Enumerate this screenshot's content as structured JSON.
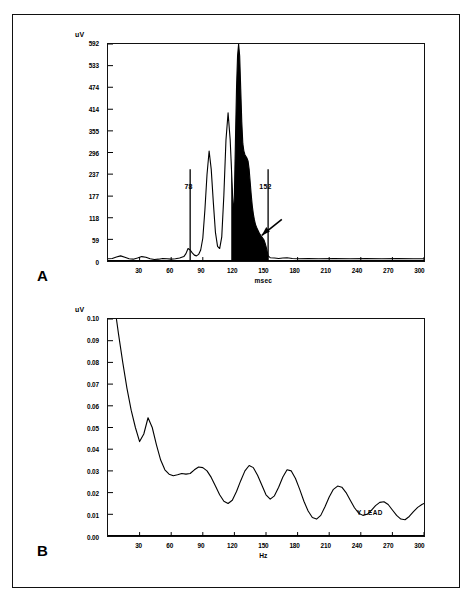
{
  "figure": {
    "panels": [
      {
        "id": "A",
        "letter": "A",
        "y_unit": "uV",
        "x_title": "msec",
        "y_ticks": [
          "592",
          "533",
          "474",
          "414",
          "355",
          "296",
          "237",
          "177",
          "118",
          "59",
          "0"
        ],
        "x_ticks": [
          "30",
          "60",
          "90",
          "120",
          "150",
          "180",
          "210",
          "240",
          "270",
          "300"
        ],
        "markers": [
          {
            "label": "78",
            "value": 78
          },
          {
            "label": "152",
            "value": 152
          }
        ],
        "annotation_icon": "arrow-pointer"
      },
      {
        "id": "B",
        "letter": "B",
        "y_unit": "uV",
        "x_title": "Hz",
        "y_ticks": [
          "0.10",
          "0.09",
          "0.08",
          "0.07",
          "0.06",
          "0.05",
          "0.04",
          "0.03",
          "0.02",
          "0.01",
          "0.00"
        ],
        "x_ticks": [
          "30",
          "60",
          "90",
          "120",
          "150",
          "180",
          "210",
          "240",
          "270",
          "300"
        ],
        "curve_label": "Y LEAD"
      }
    ]
  },
  "chart_data": [
    {
      "type": "line",
      "title": "Signal-averaged QRS complex, high-gain time domain",
      "panel": "A",
      "xlabel": "msec",
      "ylabel": "uV",
      "xlim": [
        0,
        300
      ],
      "ylim": [
        0,
        592
      ],
      "grid": false,
      "legend": "none",
      "xticks": [
        30,
        60,
        90,
        120,
        150,
        180,
        210,
        240,
        270,
        300
      ],
      "yticks": [
        0,
        59,
        118,
        177,
        237,
        296,
        355,
        414,
        474,
        533,
        592
      ],
      "annotations": [
        {
          "text": "78",
          "x": 78,
          "type": "vertical-marker",
          "note": "QRS onset"
        },
        {
          "text": "152",
          "x": 152,
          "type": "vertical-marker",
          "note": "QRS offset"
        },
        {
          "text": "",
          "x": 146,
          "y": 70,
          "type": "arrow",
          "note": "late potentials in terminal QRS"
        }
      ],
      "filled_region": {
        "x_start": 117,
        "x_end": 152,
        "fill": "#000000"
      },
      "x": [
        0,
        4,
        8,
        12,
        16,
        20,
        24,
        28,
        32,
        36,
        40,
        44,
        48,
        52,
        56,
        60,
        64,
        68,
        72,
        74,
        76,
        78,
        80,
        82,
        84,
        86,
        88,
        90,
        92,
        94,
        96,
        98,
        100,
        102,
        104,
        106,
        108,
        110,
        112,
        114,
        116,
        118,
        119,
        120,
        121,
        122,
        123,
        124,
        125,
        126,
        127,
        128,
        129,
        130,
        131,
        132,
        133,
        134,
        135,
        136,
        137,
        138,
        139,
        140,
        141,
        142,
        143,
        144,
        145,
        146,
        147,
        148,
        149,
        150,
        151,
        152,
        154,
        158,
        162,
        166,
        170,
        175,
        180,
        190,
        200,
        215,
        230,
        245,
        260,
        275,
        290,
        300
      ],
      "y": [
        6,
        7,
        11,
        14,
        10,
        6,
        5,
        8,
        12,
        10,
        6,
        4,
        5,
        7,
        6,
        5,
        6,
        8,
        12,
        20,
        34,
        30,
        22,
        16,
        14,
        18,
        30,
        62,
        140,
        236,
        300,
        250,
        160,
        78,
        40,
        34,
        66,
        180,
        330,
        404,
        330,
        200,
        120,
        180,
        330,
        470,
        560,
        592,
        560,
        470,
        380,
        320,
        300,
        290,
        285,
        280,
        272,
        250,
        215,
        180,
        150,
        128,
        112,
        100,
        92,
        86,
        80,
        74,
        70,
        66,
        62,
        58,
        50,
        40,
        28,
        14,
        9,
        8,
        7,
        8,
        9,
        7,
        6,
        7,
        6,
        7,
        6,
        7,
        6,
        7,
        6,
        6
      ]
    },
    {
      "type": "line",
      "title": "Fast Fourier transform frequency-domain spectrum, Y lead",
      "panel": "B",
      "xlabel": "Hz",
      "ylabel": "uV",
      "xlim": [
        0,
        300
      ],
      "ylim": [
        0.0,
        0.1
      ],
      "grid": false,
      "legend": "none",
      "xticks": [
        30,
        60,
        90,
        120,
        150,
        180,
        210,
        240,
        270,
        300
      ],
      "yticks": [
        0.0,
        0.01,
        0.02,
        0.03,
        0.04,
        0.05,
        0.06,
        0.07,
        0.08,
        0.09,
        0.1
      ],
      "series_name": "Y LEAD",
      "annotations": [
        {
          "text": "Y LEAD",
          "x": 268,
          "y": 0.017,
          "type": "series-label"
        }
      ],
      "x": [
        8,
        10,
        14,
        18,
        22,
        26,
        30,
        34,
        38,
        42,
        46,
        50,
        54,
        58,
        62,
        66,
        70,
        74,
        78,
        82,
        86,
        90,
        94,
        98,
        102,
        106,
        110,
        114,
        118,
        122,
        126,
        130,
        134,
        138,
        142,
        146,
        150,
        154,
        158,
        162,
        166,
        170,
        174,
        178,
        182,
        186,
        190,
        194,
        198,
        202,
        206,
        210,
        214,
        218,
        222,
        226,
        230,
        234,
        238,
        242,
        246,
        250,
        254,
        258,
        262,
        266,
        270,
        274,
        278,
        282,
        286,
        290,
        294,
        298,
        300
      ],
      "y": [
        0.1,
        0.093,
        0.08,
        0.068,
        0.058,
        0.05,
        0.0435,
        0.047,
        0.0545,
        0.05,
        0.042,
        0.035,
        0.0305,
        0.0285,
        0.0278,
        0.0282,
        0.0288,
        0.0285,
        0.0288,
        0.0305,
        0.0318,
        0.0315,
        0.03,
        0.027,
        0.023,
        0.019,
        0.016,
        0.015,
        0.0165,
        0.0205,
        0.0255,
        0.03,
        0.0325,
        0.0315,
        0.028,
        0.0235,
        0.019,
        0.017,
        0.0185,
        0.0225,
        0.0272,
        0.0305,
        0.03,
        0.0265,
        0.0215,
        0.016,
        0.0115,
        0.0085,
        0.0078,
        0.0095,
        0.0135,
        0.018,
        0.0215,
        0.023,
        0.0225,
        0.02,
        0.0165,
        0.013,
        0.0105,
        0.0095,
        0.01,
        0.0118,
        0.014,
        0.0155,
        0.0158,
        0.0145,
        0.012,
        0.0095,
        0.0078,
        0.0075,
        0.009,
        0.0112,
        0.0132,
        0.0145,
        0.015,
        0.015
      ]
    }
  ]
}
